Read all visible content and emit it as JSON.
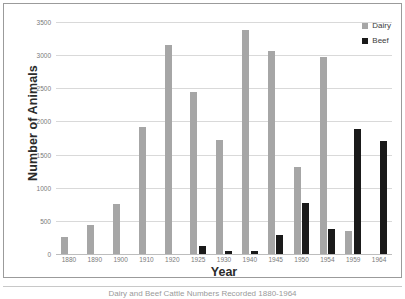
{
  "chart_data": {
    "type": "bar",
    "title": "",
    "xlabel": "Year",
    "ylabel": "Number of Animals",
    "categories": [
      "1880",
      "1890",
      "1900",
      "1910",
      "1920",
      "1925",
      "1930",
      "1940",
      "1945",
      "1950",
      "1954",
      "1959",
      "1964"
    ],
    "series": [
      {
        "name": "Dairy",
        "color": "#a6a6a6",
        "values": [
          250,
          440,
          760,
          1910,
          3160,
          2440,
          1720,
          3380,
          3070,
          1320,
          2970,
          350,
          0
        ]
      },
      {
        "name": "Beef",
        "color": "#1a1a1a",
        "values": [
          0,
          0,
          0,
          0,
          0,
          120,
          50,
          45,
          280,
          770,
          370,
          1880,
          1700
        ]
      }
    ],
    "ylim": [
      0,
      3500
    ],
    "yticks": [
      "0",
      "500",
      "1000",
      "1500",
      "2000",
      "2500",
      "3000",
      "3500"
    ],
    "ytick_values": [
      0,
      500,
      1000,
      1500,
      2000,
      2500,
      3000,
      3500
    ],
    "grid": true,
    "legend_position": "top-right"
  },
  "legend": {
    "items": [
      {
        "label": "Dairy",
        "swatch": "dairy-swatch-icon"
      },
      {
        "label": "Beef",
        "swatch": "beef-swatch-icon"
      }
    ]
  },
  "caption": {
    "text": "Dairy and Beef Cattle Numbers Recorded 1880-1964"
  }
}
